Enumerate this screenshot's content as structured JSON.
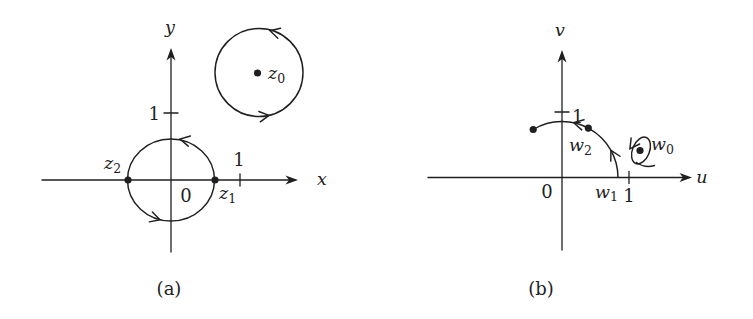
{
  "figure": {
    "background": "#ffffff",
    "ink_color": "#1f1f1f"
  },
  "panel_a": {
    "caption": "(a)",
    "x_axis_label": "x",
    "y_axis_label": "y",
    "origin_label": "0",
    "x_tick_label": "1",
    "y_tick_label": "1",
    "point_z1": {
      "base": "z",
      "sub": "1"
    },
    "point_z2": {
      "base": "z",
      "sub": "2"
    },
    "point_z0": {
      "base": "z",
      "sub": "0"
    }
  },
  "panel_b": {
    "caption": "(b)",
    "u_axis_label": "u",
    "v_axis_label": "v",
    "origin_label": "0",
    "u_tick_label": "1",
    "v_tick_label": "1",
    "point_w1": {
      "base": "w",
      "sub": "1"
    },
    "point_w2": {
      "base": "w",
      "sub": "2"
    },
    "point_w0": {
      "base": "w",
      "sub": "0"
    }
  }
}
